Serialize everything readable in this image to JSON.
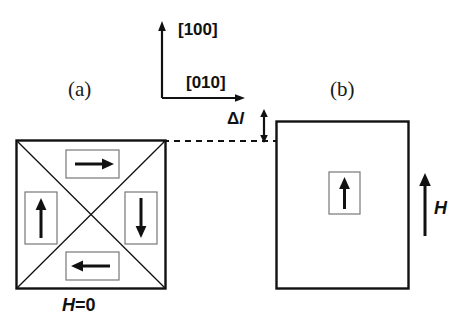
{
  "figure": {
    "background_color": "#ffffff",
    "line_color": "#111111",
    "panels": [
      {
        "id": "a",
        "label": "(a)",
        "caption": "H=0",
        "caption_symbol": "H",
        "caption_rest": "=0",
        "shape": "square",
        "domains": [
          {
            "position": "top",
            "arrow": "right-arrow-icon",
            "direction": "right"
          },
          {
            "position": "left",
            "arrow": "up-arrow-icon",
            "direction": "up"
          },
          {
            "position": "right",
            "arrow": "down-arrow-icon",
            "direction": "down"
          },
          {
            "position": "bottom",
            "arrow": "left-arrow-icon",
            "direction": "left"
          }
        ]
      },
      {
        "id": "b",
        "label": "(b)",
        "field_symbol": "H",
        "shape": "rectangle",
        "domains": [
          {
            "position": "center",
            "arrow": "up-arrow-icon",
            "direction": "up"
          }
        ]
      }
    ],
    "axes": {
      "vertical_label": "[100]",
      "horizontal_label": "[010]"
    },
    "annotation": {
      "delta_symbol": "Δ",
      "delta_quantity": "l",
      "marker": "double-headed-vertical-arrow"
    }
  }
}
